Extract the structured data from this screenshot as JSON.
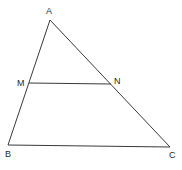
{
  "diagram": {
    "type": "triangle-midsegment",
    "points": {
      "A": {
        "label": "A",
        "x": 50,
        "y": 20
      },
      "M": {
        "label": "M",
        "x": 29,
        "y": 83
      },
      "N": {
        "label": "N",
        "x": 111,
        "y": 84
      },
      "B": {
        "label": "B",
        "x": 8,
        "y": 145
      },
      "C": {
        "label": "C",
        "x": 170,
        "y": 147
      }
    },
    "segments": [
      [
        "A",
        "B"
      ],
      [
        "A",
        "C"
      ],
      [
        "B",
        "C"
      ],
      [
        "M",
        "N"
      ]
    ],
    "stroke_color": "#3a3a3a"
  }
}
